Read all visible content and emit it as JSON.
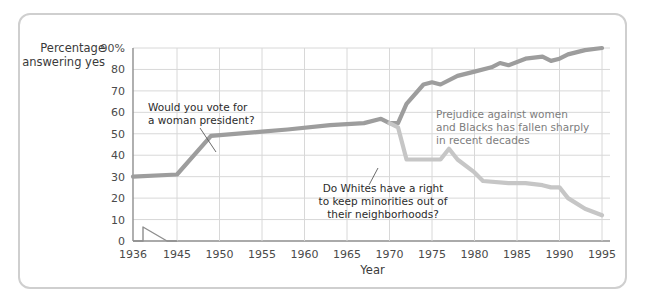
{
  "chart_data": {
    "type": "line",
    "title": "",
    "xlabel": "Year",
    "ylabel": "Percentage answering yes",
    "xlim": [
      1936,
      1998
    ],
    "ylim": [
      0,
      90
    ],
    "grid": true,
    "legend_position": "none",
    "axis_break": {
      "between": [
        1936,
        1945
      ],
      "axis": "x",
      "symbol": "zigzag"
    },
    "yticks": [
      0,
      10,
      20,
      30,
      40,
      50,
      60,
      70,
      80,
      90
    ],
    "ytick_labels": [
      "0",
      "10",
      "20",
      "30",
      "40",
      "50",
      "60",
      "70",
      "80",
      "90%"
    ],
    "xticks": [
      1936,
      1945,
      1950,
      1955,
      1960,
      1965,
      1970,
      1975,
      1980,
      1985,
      1990,
      1995
    ],
    "xtick_labels": [
      "1936",
      "1945",
      "1950",
      "1955",
      "1960",
      "1965",
      "1970",
      "1975",
      "1980",
      "1985",
      "1990",
      "1995"
    ],
    "series": [
      {
        "name": "Would you vote for a woman president?",
        "color": "#9d9d9d",
        "x": [
          1936,
          1945,
          1949,
          1955,
          1958,
          1963,
          1967,
          1969,
          1970,
          1971,
          1972,
          1974,
          1975,
          1976,
          1978,
          1980,
          1982,
          1983,
          1984,
          1986,
          1988,
          1989,
          1990,
          1991,
          1993,
          1995
        ],
        "values": [
          30,
          31,
          49,
          51,
          52,
          54,
          55,
          57,
          55,
          55,
          64,
          73,
          74,
          73,
          77,
          79,
          81,
          83,
          82,
          85,
          86,
          84,
          85,
          87,
          89,
          90
        ]
      },
      {
        "name": "Do Whites have a right to keep minorities out of their neighborhoods?",
        "color": "#c6c6c6",
        "x": [
          1970,
          1971,
          1972,
          1974,
          1976,
          1977,
          1978,
          1980,
          1981,
          1984,
          1986,
          1988,
          1989,
          1990,
          1991,
          1993,
          1995
        ],
        "values": [
          55,
          53,
          38,
          38,
          38,
          43,
          38,
          32,
          28,
          27,
          27,
          26,
          25,
          25,
          20,
          15,
          12
        ]
      }
    ],
    "annotations": [
      {
        "id": "woman-president",
        "lines": [
          "Would you vote for",
          "a woman president?"
        ],
        "align": "left",
        "text_x": 148,
        "text_y": 111,
        "leader": {
          "x1": 200,
          "y1": 128,
          "x2": 216,
          "y2": 152
        }
      },
      {
        "id": "whites-neighborhoods",
        "lines": [
          "Do Whites have a right",
          "to keep minorities out of",
          "their neighborhoods?"
        ],
        "align": "center",
        "text_x": 383,
        "text_y": 192,
        "leader": {
          "x1": 369,
          "y1": 185,
          "x2": 378,
          "y2": 168
        }
      },
      {
        "id": "prejudice-fallen",
        "lines": [
          "Prejudice against women",
          "and Blacks has fallen sharply",
          "in recent decades"
        ],
        "align": "left",
        "style": "light",
        "text_x": 436,
        "text_y": 118,
        "leader": null
      }
    ]
  },
  "plot": {
    "left": 133,
    "right": 610,
    "top": 48,
    "bottom": 241,
    "grid_color": "#d8d8d8",
    "axis_color": "#8e8e8e",
    "frame_color": "#cfcfcf",
    "background": "#ffffff"
  }
}
